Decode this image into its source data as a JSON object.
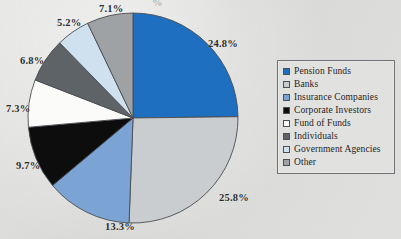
{
  "background_color": "#dededc",
  "chart_data": {
    "type": "pie",
    "title": "",
    "subtitle": "",
    "xlabel": "",
    "ylabel": "",
    "legend_position": "right",
    "grid": false,
    "start_angle_deg": 0,
    "direction": "clockwise",
    "categories": [
      "Pension Funds",
      "Banks",
      "Insurance Companies",
      "Corporate Investors",
      "Fund of Funds",
      "Individuals",
      "Government Agencies",
      "Other"
    ],
    "values": [
      24.8,
      25.8,
      13.3,
      9.7,
      7.3,
      6.8,
      5.2,
      7.1
    ],
    "value_labels": [
      "24.8%",
      "25.8%",
      "13.3%",
      "9.7%",
      "7.3%",
      "6.8%",
      "5.2%",
      "7.1%"
    ],
    "unit": "%",
    "colors": [
      "#1f6fc0",
      "#c9cdcf",
      "#7ba3d4",
      "#0d0d0d",
      "#fbfbfa",
      "#5d6367",
      "#cfe1ee",
      "#9ea2a4"
    ],
    "slice_border_color": "#4a4d50"
  },
  "labels": [
    {
      "text": "24.8%",
      "left": 208,
      "top": 38
    },
    {
      "text": "25.8%",
      "left": 219,
      "top": 192
    },
    {
      "text": "13.3%",
      "left": 105,
      "top": 221
    },
    {
      "text": "9.7%",
      "left": 16,
      "top": 160
    },
    {
      "text": "7.3%",
      "left": 6,
      "top": 103
    },
    {
      "text": "6.8%",
      "left": 20,
      "top": 55
    },
    {
      "text": "5.2%",
      "left": 57,
      "top": 17
    },
    {
      "text": "7.1%",
      "left": 99,
      "top": 3
    }
  ],
  "legend": {
    "items": [
      {
        "label": "Pension Funds",
        "color": "#1f6fc0"
      },
      {
        "label": "Banks",
        "color": "#c9cdcf"
      },
      {
        "label": "Insurance Companies",
        "color": "#7ba3d4"
      },
      {
        "label": "Corporate Investors",
        "color": "#0d0d0d"
      },
      {
        "label": "Fund of Funds",
        "color": "#fbfbfa"
      },
      {
        "label": "Individuals",
        "color": "#5d6367"
      },
      {
        "label": "Government Agencies",
        "color": "#cfe1ee"
      },
      {
        "label": "Other",
        "color": "#9ea2a4"
      }
    ]
  },
  "artifacts": {
    "top_clipped_text": "%"
  },
  "geometry": {
    "center_x": 133,
    "center_y": 118,
    "radius": 105
  }
}
